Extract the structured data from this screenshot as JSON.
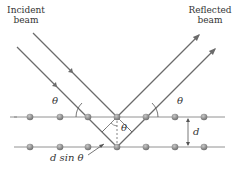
{
  "labels": {
    "incident_line1": "Incident",
    "incident_line2": "beam",
    "reflected_line1": "Reflected",
    "reflected_line2": "beam",
    "theta_left": "θ",
    "theta_right": "θ",
    "theta_center": "θ",
    "spacing": "d",
    "path_diff": "d sin θ"
  },
  "colors": {
    "beam": "#6b6b6b",
    "atom": "#8a8a8a",
    "line": "#777777",
    "text": "#333333"
  },
  "layers": {
    "top_y": 117,
    "bottom_y": 147,
    "atom_x": [
      30,
      60,
      88,
      117,
      146,
      175,
      204
    ]
  }
}
